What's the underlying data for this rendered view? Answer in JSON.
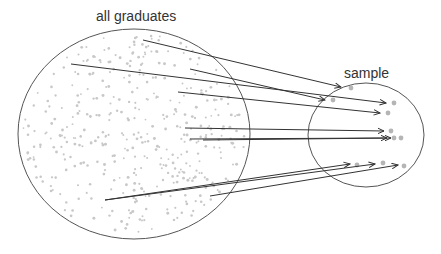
{
  "labels": {
    "population": "all graduates",
    "sample": "sample"
  },
  "colors": {
    "outline": "#555555",
    "dot": "#c8c8c8",
    "sample_dot": "#b5b5b5",
    "arrow": "#333333"
  },
  "population_circle": {
    "cx": 134,
    "cy": 134,
    "rx": 116,
    "ry": 105
  },
  "sample_circle": {
    "cx": 366,
    "cy": 135,
    "rx": 58,
    "ry": 52
  },
  "arrows": [
    {
      "x1": 143,
      "y1": 40,
      "x2": 341,
      "y2": 87,
      "dot": [
        351,
        88
      ]
    },
    {
      "x1": 71,
      "y1": 64,
      "x2": 386,
      "y2": 103,
      "dot": [
        394,
        103
      ]
    },
    {
      "x1": 190,
      "y1": 69,
      "x2": 325,
      "y2": 100,
      "dot": [
        333,
        100
      ]
    },
    {
      "x1": 178,
      "y1": 92,
      "x2": 380,
      "y2": 113,
      "dot": [
        388,
        113
      ]
    },
    {
      "x1": 185,
      "y1": 128,
      "x2": 384,
      "y2": 131,
      "dot": [
        391,
        131
      ]
    },
    {
      "x1": 190,
      "y1": 139,
      "x2": 387,
      "y2": 138,
      "dot": [
        394,
        138
      ]
    },
    {
      "x1": 203,
      "y1": 140,
      "x2": 391,
      "y2": 138,
      "dot": [
        401,
        138
      ]
    },
    {
      "x1": 105,
      "y1": 200,
      "x2": 350,
      "y2": 164,
      "dot": [
        357,
        165
      ]
    },
    {
      "x1": 210,
      "y1": 196,
      "x2": 398,
      "y2": 165,
      "dot": [
        404,
        166
      ]
    },
    {
      "x1": 105,
      "y1": 200,
      "x2": 375,
      "y2": 164,
      "dot": [
        383,
        163
      ]
    }
  ]
}
